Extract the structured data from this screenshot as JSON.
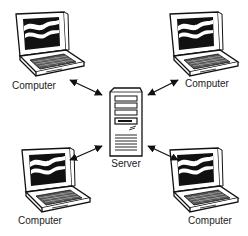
{
  "diagram": {
    "type": "client-server network",
    "server": {
      "label": "Server",
      "icon": "server-tower-icon"
    },
    "computers": [
      {
        "position": "top-left",
        "label": "Computer",
        "icon": "laptop-icon"
      },
      {
        "position": "top-right",
        "label": "Computer",
        "icon": "laptop-icon"
      },
      {
        "position": "bottom-left",
        "label": "Computer",
        "icon": "laptop-icon"
      },
      {
        "position": "bottom-right",
        "label": "Computer",
        "icon": "laptop-icon"
      }
    ],
    "connections": [
      {
        "from": "top-left",
        "to": "server",
        "style": "double-arrow"
      },
      {
        "from": "top-right",
        "to": "server",
        "style": "double-arrow"
      },
      {
        "from": "bottom-left",
        "to": "server",
        "style": "double-arrow"
      },
      {
        "from": "bottom-right",
        "to": "server",
        "style": "double-arrow"
      }
    ],
    "colors": {
      "stroke": "#111111",
      "background": "#ffffff",
      "screen": "#111111"
    }
  }
}
